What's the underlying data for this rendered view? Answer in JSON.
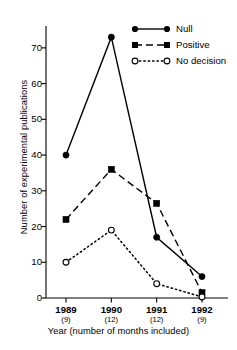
{
  "chart_data": {
    "type": "line",
    "title": "",
    "xlabel": "Year (number of months included)",
    "ylabel": "Number of experimental publications",
    "categories": [
      "1989",
      "1990",
      "1991",
      "1992"
    ],
    "category_sublabels": [
      "(9)",
      "(12)",
      "(12)",
      "(9)"
    ],
    "x": [
      1989,
      1990,
      1991,
      1992
    ],
    "ylim": [
      0,
      75
    ],
    "yticks": [
      0,
      10,
      20,
      30,
      40,
      50,
      60,
      70
    ],
    "ytick_labels": [
      "0",
      "10",
      "20",
      "30",
      "40",
      "50",
      "60",
      "70"
    ],
    "grid": false,
    "legend_position": "top-right",
    "series": [
      {
        "name": "Null",
        "values": [
          40,
          73,
          17,
          6
        ],
        "line_style": "solid",
        "marker": "filled-circle",
        "color": "#000000"
      },
      {
        "name": "Positive",
        "values": [
          22,
          36,
          26.5,
          1.5
        ],
        "line_style": "dashed",
        "marker": "filled-square",
        "color": "#000000"
      },
      {
        "name": "No decision",
        "values": [
          10,
          19,
          4,
          0.3
        ],
        "line_style": "dotted",
        "marker": "open-circle",
        "color": "#000000"
      }
    ]
  },
  "legend": {
    "entries": [
      {
        "label": "Null"
      },
      {
        "label": "Positive"
      },
      {
        "label": "No decision"
      }
    ]
  }
}
